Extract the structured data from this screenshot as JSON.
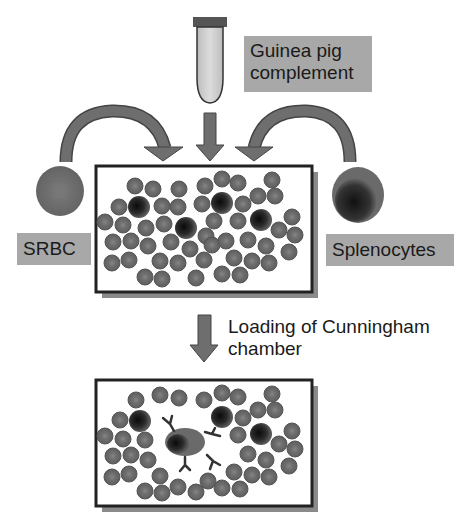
{
  "diagram": {
    "labels": {
      "complement_line1": "Guinea pig",
      "complement_line2": "complement",
      "srbc": "SRBC",
      "splenocytes": "Splenocytes",
      "loading_line1": "Loading of Cunningham",
      "loading_line2": "chamber"
    },
    "colors": {
      "label_bg": "#a8a8a8",
      "arrow": "#6e6e6e",
      "rbc_fill": "#6a6a6a",
      "rbc_center": "#7c7c7c",
      "lymphocyte_dark": "#1e1e1e",
      "box_border": "#222222",
      "box_shadow": "#8a8a8a",
      "tube_fill": "#cfcfcf",
      "tube_cap": "#555555"
    },
    "icons": {
      "tube": "microcentrifuge-tube-icon",
      "srbc_cell": "red-blood-cell-icon",
      "splenocyte_cell": "lymphocyte-icon",
      "antibody": "antibody-y-icon"
    }
  }
}
